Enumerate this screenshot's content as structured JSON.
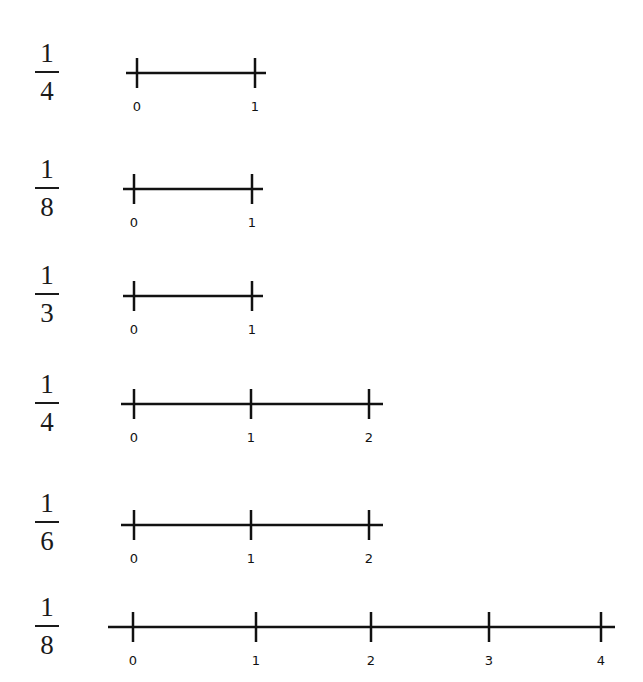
{
  "rows": [
    {
      "fraction": {
        "numerator": "1",
        "denominator": "4"
      },
      "line": {
        "y": 73,
        "x1": 126,
        "x2": 266
      },
      "ticks": [
        {
          "x": 137,
          "label": "0"
        },
        {
          "x": 255,
          "label": "1"
        }
      ]
    },
    {
      "fraction": {
        "numerator": "1",
        "denominator": "8"
      },
      "line": {
        "y": 189,
        "x1": 123,
        "x2": 263
      },
      "ticks": [
        {
          "x": 134,
          "label": "0"
        },
        {
          "x": 252,
          "label": "1"
        }
      ]
    },
    {
      "fraction": {
        "numerator": "1",
        "denominator": "3"
      },
      "line": {
        "y": 296,
        "x1": 123,
        "x2": 263
      },
      "ticks": [
        {
          "x": 134,
          "label": "0"
        },
        {
          "x": 252,
          "label": "1"
        }
      ]
    },
    {
      "fraction": {
        "numerator": "1",
        "denominator": "4"
      },
      "line": {
        "y": 404,
        "x1": 121,
        "x2": 383
      },
      "ticks": [
        {
          "x": 134,
          "label": "0"
        },
        {
          "x": 251,
          "label": "1"
        },
        {
          "x": 369,
          "label": "2"
        }
      ]
    },
    {
      "fraction": {
        "numerator": "1",
        "denominator": "6"
      },
      "line": {
        "y": 525,
        "x1": 121,
        "x2": 383
      },
      "ticks": [
        {
          "x": 134,
          "label": "0"
        },
        {
          "x": 251,
          "label": "1"
        },
        {
          "x": 369,
          "label": "2"
        }
      ]
    },
    {
      "fraction": {
        "numerator": "1",
        "denominator": "8"
      },
      "line": {
        "y": 627,
        "x1": 108,
        "x2": 615
      },
      "ticks": [
        {
          "x": 133,
          "label": "0"
        },
        {
          "x": 256,
          "label": "1"
        },
        {
          "x": 371,
          "label": "2"
        },
        {
          "x": 489,
          "label": "3"
        },
        {
          "x": 601,
          "label": "4"
        }
      ]
    }
  ],
  "fraction_positions": [
    {
      "x": 32,
      "y": 40
    },
    {
      "x": 32,
      "y": 156
    },
    {
      "x": 32,
      "y": 262
    },
    {
      "x": 32,
      "y": 371
    },
    {
      "x": 32,
      "y": 490
    },
    {
      "x": 32,
      "y": 594
    }
  ],
  "colors": {
    "ink": "#111111",
    "background": "#ffffff"
  }
}
